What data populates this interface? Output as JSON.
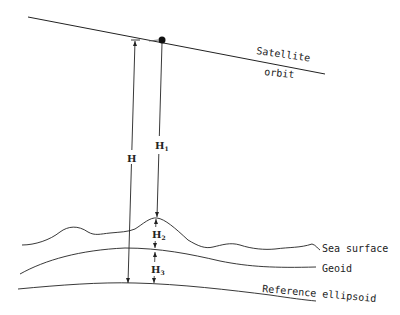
{
  "diagram": {
    "title": "",
    "labels": {
      "satellite_orbit_line1": "Satellite",
      "satellite_orbit_line2": "orbit",
      "sea_surface": "Sea surface",
      "geoid": "Geoid",
      "reference_ellipsoid": "Reference ellipsoid"
    },
    "heights": {
      "H": "H",
      "H1_base": "H",
      "H1_sub": "1",
      "H2_base": "H",
      "H2_sub": "2",
      "H3_base": "H",
      "H3_sub": "3"
    },
    "nodes": [
      "Satellite",
      "Satellite orbit",
      "Sea surface",
      "Geoid",
      "Reference ellipsoid"
    ],
    "relations": [
      {
        "name": "H",
        "from": "Satellite orbit",
        "to": "Reference ellipsoid"
      },
      {
        "name": "H1",
        "from": "Satellite",
        "to": "Sea surface"
      },
      {
        "name": "H2",
        "from": "Sea surface",
        "to": "Geoid"
      },
      {
        "name": "H3",
        "from": "Geoid",
        "to": "Reference ellipsoid"
      }
    ]
  }
}
